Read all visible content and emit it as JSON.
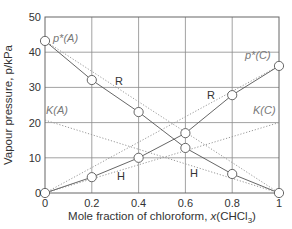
{
  "chart_data": {
    "type": "line",
    "title": "",
    "xlabel": "Mole fraction of chloroform, x(CHCl3)",
    "ylabel": "Vapour pressure, p/kPa",
    "xlim": [
      0,
      1
    ],
    "ylim": [
      0,
      50
    ],
    "x_ticks": [
      "0",
      "0.2",
      "0.4",
      "0.6",
      "0.8",
      "1"
    ],
    "y_ticks": [
      "0",
      "10",
      "20",
      "30",
      "40",
      "50"
    ],
    "grid": true,
    "legend": null,
    "series": [
      {
        "name": "Acetone (A) partial vapour pressure",
        "style": "solid with circle markers",
        "x": [
          0,
          0.2,
          0.4,
          0.6,
          0.8,
          1.0
        ],
        "y": [
          43.2,
          32.1,
          23.0,
          12.8,
          5.4,
          0
        ]
      },
      {
        "name": "Chloroform (C) partial vapour pressure",
        "style": "solid with circle markers",
        "x": [
          0,
          0.2,
          0.4,
          0.6,
          0.8,
          1.0
        ],
        "y": [
          0,
          4.5,
          10.0,
          17.0,
          27.8,
          36.1
        ]
      },
      {
        "name": "Raoult's law (A)",
        "style": "dotted",
        "x": [
          0,
          1
        ],
        "y": [
          43.2,
          0
        ]
      },
      {
        "name": "Raoult's law (C)",
        "style": "dotted",
        "x": [
          0,
          1
        ],
        "y": [
          0,
          36.1
        ]
      },
      {
        "name": "Henry's law (A), K(A)",
        "style": "dotted",
        "x": [
          0,
          1
        ],
        "y": [
          20.7,
          0
        ]
      },
      {
        "name": "Henry's law (C), K(C)",
        "style": "dotted",
        "x": [
          0,
          1
        ],
        "y": [
          0,
          20.0
        ]
      }
    ],
    "annotations": [
      {
        "text": "p*(A)",
        "x": 0.02,
        "y": 44
      },
      {
        "text": "p*(C)",
        "x": 0.86,
        "y": 40
      },
      {
        "text": "K(A)",
        "x": 0.02,
        "y": 22
      },
      {
        "text": "K(C)",
        "x": 0.89,
        "y": 22
      },
      {
        "text": "R",
        "x": 0.33,
        "y": 30
      },
      {
        "text": "R",
        "x": 0.72,
        "y": 28
      },
      {
        "text": "H",
        "x": 0.33,
        "y": 5.5
      },
      {
        "text": "H",
        "x": 0.66,
        "y": 8
      }
    ]
  },
  "labels": {
    "xlabel_main": "Mole fraction of chloroform, ",
    "xlabel_var": "x",
    "xlabel_paren_open": "(CHCl",
    "xlabel_sub": "3",
    "xlabel_paren_close": ")",
    "ylabel": "Vapour pressure, p/kPa",
    "pA": "p*(A)",
    "pC": "p*(C)",
    "KA": "K(A)",
    "KC": "K(C)",
    "R": "R",
    "H": "H"
  }
}
